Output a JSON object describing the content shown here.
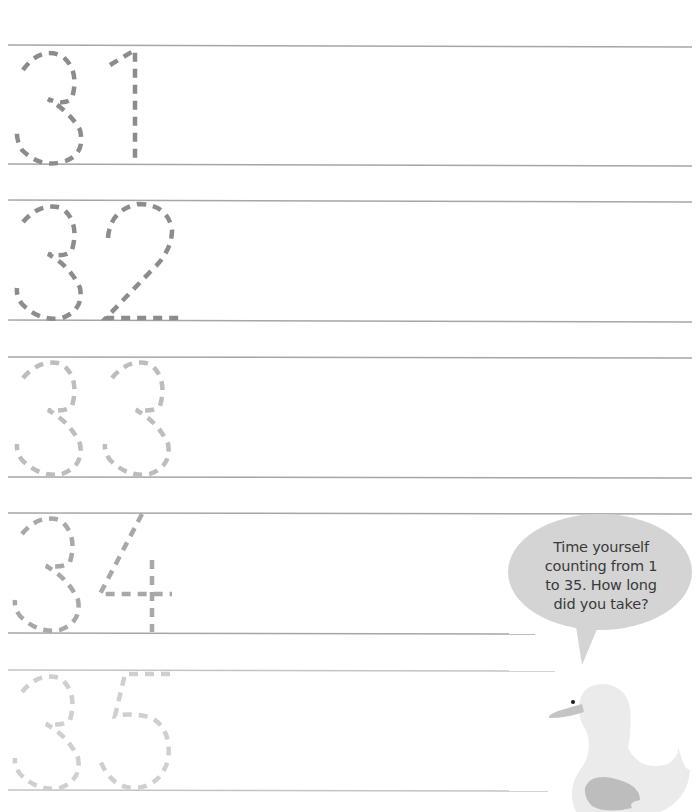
{
  "worksheet": {
    "rows": [
      {
        "number": "31",
        "digits": [
          "3",
          "1"
        ],
        "tone": "#8c8c8c"
      },
      {
        "number": "32",
        "digits": [
          "3",
          "2"
        ],
        "tone": "#8c8c8c"
      },
      {
        "number": "33",
        "digits": [
          "3",
          "3"
        ],
        "tone": "#bdbdbd"
      },
      {
        "number": "34",
        "digits": [
          "3",
          "4"
        ],
        "tone": "#a8a8a8"
      },
      {
        "number": "35",
        "digits": [
          "3",
          "5"
        ],
        "tone": "#cfcfcf"
      }
    ],
    "line_color": "#a6a6a6"
  },
  "speech_bubble": {
    "lines": [
      "Time yourself",
      "counting from 1",
      "to 35. How long",
      "did you take?"
    ],
    "fill": "#d4d4d4"
  },
  "mascot": {
    "icon": "duck-icon",
    "body_color": "#ebebeb",
    "wing_color": "#bdbdbd",
    "beak_color": "#c4c4c4"
  }
}
